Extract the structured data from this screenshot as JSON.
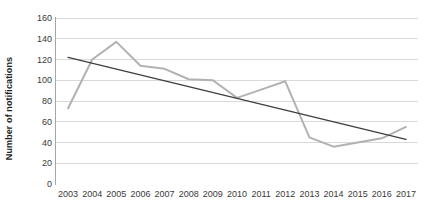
{
  "chart_data": {
    "type": "line",
    "title": "",
    "xlabel": "",
    "ylabel": "Number of notifications",
    "categories": [
      "2003",
      "2004",
      "2005",
      "2006",
      "2007",
      "2008",
      "2009",
      "2010",
      "2011",
      "2012",
      "2013",
      "2014",
      "2015",
      "2016",
      "2017"
    ],
    "ylim": [
      0,
      160
    ],
    "ytick_values": [
      0,
      20,
      40,
      60,
      80,
      100,
      120,
      140,
      160
    ],
    "ytick_labels": [
      "0",
      "20",
      "40",
      "60",
      "80",
      "100",
      "120",
      "140",
      "160"
    ],
    "grid": "horizontal",
    "legend": "none",
    "series": [
      {
        "name": "Number of notifications",
        "type": "line",
        "color": "#b2b2b2",
        "values": [
          73,
          120,
          137,
          114,
          111,
          101,
          100,
          83,
          91,
          99,
          45,
          36,
          40,
          44,
          55
        ]
      },
      {
        "name": "Linear trend",
        "type": "trendline",
        "color": "#3f3f3f",
        "values": [
          122,
          116,
          111,
          105,
          100,
          94,
          88,
          83,
          77,
          72,
          66,
          60,
          55,
          49,
          43
        ]
      }
    ],
    "colors": {
      "series_line": "#b2b2b2",
      "trendline": "#3f3f3f",
      "gridline": "#d9d9d9",
      "axis": "#a6a6a6",
      "tick_text": "#3a3a3a",
      "axis_title": "#231f20",
      "background": "#ffffff"
    }
  }
}
